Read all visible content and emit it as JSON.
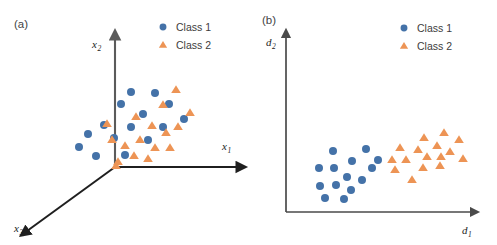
{
  "figure": {
    "width": 497,
    "height": 245,
    "background": "#ffffff"
  },
  "colors": {
    "class1": "#4472a8",
    "class2": "#ed9455",
    "axis_dark": "#1f1f1f",
    "axis_gray": "#5b5b5b",
    "text": "#3a3a3a"
  },
  "panels": [
    {
      "tag": "(a)",
      "tag_x": 14,
      "tag_y": 28,
      "type": "3d-axes",
      "axes": [
        {
          "name": "x-2-axis",
          "label": "x",
          "sub": "2",
          "label_x": 92,
          "label_y": 48,
          "x1": 115,
          "y1": 167,
          "x2": 115,
          "y2": 38
        },
        {
          "name": "x-1-axis",
          "label": "x",
          "sub": "1",
          "label_x": 222,
          "label_y": 150,
          "x1": 115,
          "y1": 167,
          "x2": 238,
          "y2": 167
        },
        {
          "name": "x-3-axis",
          "label": "x",
          "sub": "3",
          "label_x": 14,
          "label_y": 232,
          "x1": 115,
          "y1": 167,
          "x2": 27,
          "y2": 231
        }
      ],
      "legend": {
        "x": 163,
        "y": 27,
        "row_gap": 18,
        "entries": [
          {
            "label": "Class 1",
            "marker": "circle",
            "color": "#4472a8"
          },
          {
            "label": "Class 2",
            "marker": "triangle",
            "color": "#ed9455"
          }
        ]
      }
    },
    {
      "tag": "(b)",
      "tag_x": 262,
      "tag_y": 24,
      "type": "2d-axes",
      "axes": [
        {
          "name": "d-2-axis",
          "label": "d",
          "sub": "2",
          "label_x": 266,
          "label_y": 46,
          "x1": 286,
          "y1": 212,
          "x2": 286,
          "y2": 36
        },
        {
          "name": "d-1-axis",
          "label": "d",
          "sub": "1",
          "label_x": 462,
          "label_y": 234,
          "x1": 286,
          "y1": 212,
          "x2": 472,
          "y2": 212
        }
      ],
      "legend": {
        "x": 404,
        "y": 28,
        "row_gap": 18,
        "entries": [
          {
            "label": "Class 1",
            "marker": "circle",
            "color": "#4472a8"
          },
          {
            "label": "Class 2",
            "marker": "triangle",
            "color": "#ed9455"
          }
        ]
      }
    }
  ],
  "chart_data": {
    "type": "scatter",
    "title": "",
    "subplots": [
      {
        "tag": "(a)",
        "description": "Original feature space with three axes; the two classes overlap heavily and are not separable.",
        "xlabel": "x1",
        "ylabel": "x2",
        "zlabel": "x3",
        "grid": false,
        "legend_position": "top-right",
        "separable": false,
        "series": [
          {
            "name": "Class 1",
            "marker": "circle",
            "color": "#4472a8",
            "count": 15,
            "points": [
              [
                131,
                92
              ],
              [
                155,
                93
              ],
              [
                121,
                104
              ],
              [
                143,
                114
              ],
              [
                104,
                125
              ],
              [
                131,
                127
              ],
              [
                163,
                127
              ],
              [
                184,
                119
              ],
              [
                88,
                134
              ],
              [
                148,
                140
              ],
              [
                114,
                138
              ],
              [
                79,
                147
              ],
              [
                96,
                156
              ],
              [
                125,
                155
              ],
              [
                169,
                104
              ]
            ]
          },
          {
            "name": "Class 2",
            "marker": "triangle",
            "color": "#ed9455",
            "count": 17,
            "points": [
              [
                176,
                90
              ],
              [
                163,
                105
              ],
              [
                136,
                117
              ],
              [
                190,
                113
              ],
              [
                107,
                124
              ],
              [
                152,
                126
              ],
              [
                112,
                140
              ],
              [
                178,
                127
              ],
              [
                166,
                133
              ],
              [
                140,
                140
              ],
              [
                125,
                146
              ],
              [
                155,
                148
              ],
              [
                170,
                148
              ],
              [
                134,
                156
              ],
              [
                148,
                159
              ],
              [
                118,
                162
              ],
              [
                116,
                166
              ]
            ]
          }
        ]
      },
      {
        "tag": "(b)",
        "description": "Learned 2-D embedding space; the two classes form well separated clusters.",
        "xlabel": "d1",
        "ylabel": "d2",
        "grid": false,
        "legend_position": "top-right",
        "separable": true,
        "series": [
          {
            "name": "Class 1",
            "marker": "circle",
            "color": "#4472a8",
            "count": 14,
            "points": [
              [
                333,
                151
              ],
              [
                366,
                149
              ],
              [
                352,
                161
              ],
              [
                319,
                168
              ],
              [
                334,
                168
              ],
              [
                372,
                168
              ],
              [
                347,
                177
              ],
              [
                362,
                180
              ],
              [
                320,
                186
              ],
              [
                336,
                185
              ],
              [
                351,
                190
              ],
              [
                325,
                198
              ],
              [
                344,
                199
              ],
              [
                378,
                160
              ]
            ]
          },
          {
            "name": "Class 2",
            "marker": "triangle",
            "color": "#ed9455",
            "count": 16,
            "points": [
              [
                424,
                138
              ],
              [
                444,
                133
              ],
              [
                459,
                140
              ],
              [
                400,
                148
              ],
              [
                418,
                150
              ],
              [
                437,
                146
              ],
              [
                450,
                152
              ],
              [
                392,
                160
              ],
              [
                406,
                160
              ],
              [
                427,
                157
              ],
              [
                441,
                157
              ],
              [
                463,
                159
              ],
              [
                395,
                170
              ],
              [
                423,
                168
              ],
              [
                440,
                166
              ],
              [
                412,
                180
              ]
            ]
          }
        ]
      }
    ]
  }
}
